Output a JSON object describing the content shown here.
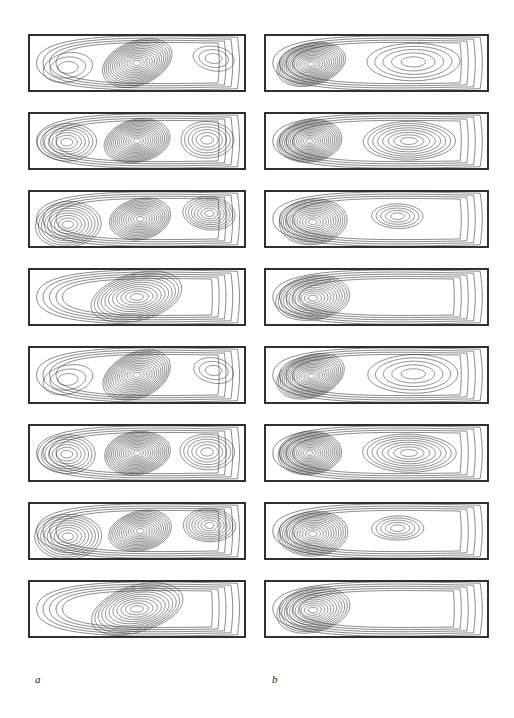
{
  "figure": {
    "type": "contour-plot-grid",
    "columns": [
      {
        "id": "a",
        "label": "a",
        "label_x": 35,
        "label_y": 673,
        "box_left": 29,
        "box_right": 245
      },
      {
        "id": "b",
        "label": "b",
        "label_x": 272,
        "label_y": 673,
        "box_left": 265,
        "box_right": 488
      }
    ],
    "rows": 8,
    "row_tops": [
      35,
      113,
      191,
      269,
      347,
      425,
      503,
      581
    ],
    "panel_height": 56,
    "frame_color": "#1a1a1a",
    "contour_color": "#2b2b2b",
    "background_color": "#ffffff"
  },
  "chart_data": {
    "type": "contour",
    "title": "",
    "xlabel": "",
    "ylabel": "",
    "grid": false,
    "legend": "none",
    "aspect_ratio_x": 216,
    "aspect_ratio_y": 56,
    "panel_count": 16,
    "column_a": {
      "label": "a",
      "pattern_cycle": 4,
      "panels": [
        {
          "row": 1,
          "pattern": "three-cell-asymmetric",
          "cells": [
            {
              "cx": 0.18,
              "cy": 0.58,
              "rx": 0.115,
              "ry": 0.26,
              "levels": 3,
              "rot": -12,
              "intensity": "weak"
            },
            {
              "cx": 0.5,
              "cy": 0.5,
              "rx": 0.165,
              "ry": 0.4,
              "levels": 14,
              "rot": -22,
              "intensity": "strong"
            },
            {
              "cx": 0.855,
              "cy": 0.42,
              "rx": 0.095,
              "ry": 0.22,
              "levels": 3,
              "rot": 12,
              "intensity": "weak"
            }
          ]
        },
        {
          "row": 2,
          "pattern": "three-cell-symmetric",
          "cells": [
            {
              "cx": 0.175,
              "cy": 0.52,
              "rx": 0.135,
              "ry": 0.34,
              "levels": 7,
              "rot": 0,
              "intensity": "medium"
            },
            {
              "cx": 0.5,
              "cy": 0.5,
              "rx": 0.155,
              "ry": 0.38,
              "levels": 15,
              "rot": -10,
              "intensity": "strong"
            },
            {
              "cx": 0.825,
              "cy": 0.48,
              "rx": 0.125,
              "ry": 0.32,
              "levels": 6,
              "rot": 0,
              "intensity": "medium"
            }
          ]
        },
        {
          "row": 3,
          "pattern": "three-cell-wide-merged",
          "cells": [
            {
              "cx": 0.18,
              "cy": 0.6,
              "rx": 0.155,
              "ry": 0.4,
              "levels": 9,
              "rot": -4,
              "intensity": "medium"
            },
            {
              "cx": 0.515,
              "cy": 0.5,
              "rx": 0.145,
              "ry": 0.36,
              "levels": 13,
              "rot": -14,
              "intensity": "strong"
            },
            {
              "cx": 0.835,
              "cy": 0.4,
              "rx": 0.12,
              "ry": 0.3,
              "levels": 8,
              "rot": 4,
              "intensity": "medium"
            }
          ]
        },
        {
          "row": 4,
          "pattern": "single-tilted-core",
          "cells": [
            {
              "cx": 0.5,
              "cy": 0.5,
              "rx": 0.215,
              "ry": 0.42,
              "levels": 11,
              "rot": -16,
              "intensity": "strong"
            }
          ]
        },
        {
          "row": 5,
          "pattern": "three-cell-asymmetric",
          "cells": [
            {
              "cx": 0.18,
              "cy": 0.58,
              "rx": 0.115,
              "ry": 0.26,
              "levels": 3,
              "rot": -12,
              "intensity": "weak"
            },
            {
              "cx": 0.5,
              "cy": 0.5,
              "rx": 0.165,
              "ry": 0.4,
              "levels": 14,
              "rot": -22,
              "intensity": "strong"
            },
            {
              "cx": 0.855,
              "cy": 0.42,
              "rx": 0.095,
              "ry": 0.22,
              "levels": 3,
              "rot": 12,
              "intensity": "weak"
            }
          ]
        },
        {
          "row": 6,
          "pattern": "three-cell-symmetric",
          "cells": [
            {
              "cx": 0.175,
              "cy": 0.52,
              "rx": 0.135,
              "ry": 0.34,
              "levels": 7,
              "rot": 0,
              "intensity": "medium"
            },
            {
              "cx": 0.5,
              "cy": 0.5,
              "rx": 0.155,
              "ry": 0.38,
              "levels": 15,
              "rot": -10,
              "intensity": "strong"
            },
            {
              "cx": 0.825,
              "cy": 0.48,
              "rx": 0.125,
              "ry": 0.32,
              "levels": 6,
              "rot": 0,
              "intensity": "medium"
            }
          ]
        },
        {
          "row": 7,
          "pattern": "three-cell-wide-merged",
          "cells": [
            {
              "cx": 0.18,
              "cy": 0.6,
              "rx": 0.155,
              "ry": 0.4,
              "levels": 9,
              "rot": -4,
              "intensity": "medium"
            },
            {
              "cx": 0.515,
              "cy": 0.5,
              "rx": 0.145,
              "ry": 0.36,
              "levels": 13,
              "rot": -14,
              "intensity": "strong"
            },
            {
              "cx": 0.835,
              "cy": 0.4,
              "rx": 0.12,
              "ry": 0.3,
              "levels": 8,
              "rot": 4,
              "intensity": "medium"
            }
          ]
        },
        {
          "row": 8,
          "pattern": "single-tilted-core",
          "cells": [
            {
              "cx": 0.5,
              "cy": 0.5,
              "rx": 0.215,
              "ry": 0.42,
              "levels": 11,
              "rot": -16,
              "intensity": "strong"
            }
          ]
        }
      ]
    },
    "column_b": {
      "label": "b",
      "pattern_cycle": 4,
      "panels": [
        {
          "row": 1,
          "pattern": "two-cell-left-dominant",
          "cells": [
            {
              "cx": 0.205,
              "cy": 0.52,
              "rx": 0.155,
              "ry": 0.38,
              "levels": 15,
              "rot": -16,
              "intensity": "strong"
            },
            {
              "cx": 0.665,
              "cy": 0.48,
              "rx": 0.205,
              "ry": 0.34,
              "levels": 5,
              "rot": 0,
              "intensity": "weak"
            }
          ]
        },
        {
          "row": 2,
          "pattern": "two-cell-balanced",
          "cells": [
            {
              "cx": 0.2,
              "cy": 0.5,
              "rx": 0.145,
              "ry": 0.38,
              "levels": 15,
              "rot": -6,
              "intensity": "strong"
            },
            {
              "cx": 0.645,
              "cy": 0.5,
              "rx": 0.21,
              "ry": 0.34,
              "levels": 8,
              "rot": 0,
              "intensity": "medium"
            }
          ]
        },
        {
          "row": 3,
          "pattern": "two-cell-merged-tail",
          "cells": [
            {
              "cx": 0.215,
              "cy": 0.55,
              "rx": 0.155,
              "ry": 0.4,
              "levels": 13,
              "rot": -6,
              "intensity": "strong"
            },
            {
              "cx": 0.595,
              "cy": 0.45,
              "rx": 0.115,
              "ry": 0.22,
              "levels": 5,
              "rot": 0,
              "intensity": "medium"
            }
          ]
        },
        {
          "row": 4,
          "pattern": "single-left-core-long-tail",
          "cells": [
            {
              "cx": 0.215,
              "cy": 0.52,
              "rx": 0.165,
              "ry": 0.4,
              "levels": 12,
              "rot": -10,
              "intensity": "strong"
            }
          ]
        },
        {
          "row": 5,
          "pattern": "two-cell-left-dominant",
          "cells": [
            {
              "cx": 0.205,
              "cy": 0.52,
              "rx": 0.155,
              "ry": 0.38,
              "levels": 15,
              "rot": -16,
              "intensity": "strong"
            },
            {
              "cx": 0.665,
              "cy": 0.48,
              "rx": 0.205,
              "ry": 0.34,
              "levels": 5,
              "rot": 0,
              "intensity": "weak"
            }
          ]
        },
        {
          "row": 6,
          "pattern": "two-cell-balanced",
          "cells": [
            {
              "cx": 0.2,
              "cy": 0.5,
              "rx": 0.145,
              "ry": 0.38,
              "levels": 15,
              "rot": -6,
              "intensity": "strong"
            },
            {
              "cx": 0.645,
              "cy": 0.5,
              "rx": 0.21,
              "ry": 0.34,
              "levels": 8,
              "rot": 0,
              "intensity": "medium"
            }
          ]
        },
        {
          "row": 7,
          "pattern": "two-cell-merged-tail",
          "cells": [
            {
              "cx": 0.215,
              "cy": 0.55,
              "rx": 0.155,
              "ry": 0.4,
              "levels": 13,
              "rot": -6,
              "intensity": "strong"
            },
            {
              "cx": 0.595,
              "cy": 0.45,
              "rx": 0.115,
              "ry": 0.22,
              "levels": 5,
              "rot": 0,
              "intensity": "medium"
            }
          ]
        },
        {
          "row": 8,
          "pattern": "single-left-core-long-tail",
          "cells": [
            {
              "cx": 0.215,
              "cy": 0.52,
              "rx": 0.165,
              "ry": 0.4,
              "levels": 12,
              "rot": -10,
              "intensity": "strong"
            }
          ]
        }
      ]
    }
  }
}
